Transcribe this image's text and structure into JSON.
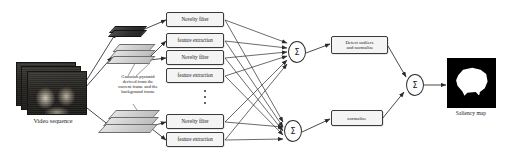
{
  "diagram": {
    "input": {
      "caption": "Video sequence"
    },
    "annotation": {
      "lines": [
        "Gaussian pyramid",
        "derived from the",
        "current frame and the",
        "background frame"
      ]
    },
    "ellipsis": "vertical-ellipsis",
    "branches": [
      {
        "id": "top",
        "boxes": [
          {
            "label": "Novelty filter"
          },
          {
            "label": "feature extraction"
          }
        ]
      },
      {
        "id": "middle",
        "boxes": [
          {
            "label": "Novelty filter"
          },
          {
            "label": "feature extraction"
          }
        ]
      },
      {
        "id": "bottom",
        "boxes": [
          {
            "label": "Novelty filter"
          },
          {
            "label": "feature extraction"
          }
        ]
      }
    ],
    "summation": {
      "symbol": "Σ",
      "nodes": [
        {
          "id": "sum-top"
        },
        {
          "id": "sum-bottom"
        },
        {
          "id": "sum-final"
        }
      ]
    },
    "post_processing": [
      {
        "id": "outliers",
        "lines": [
          "Detect outliers",
          "and normalize"
        ]
      },
      {
        "id": "normalize",
        "lines": [
          "normalize"
        ]
      }
    ],
    "output": {
      "caption": "Saliency map"
    },
    "colors": {
      "box_fill": "#f4f4f4",
      "box_border": "#3a3a3a",
      "wire": "#2b2b2b",
      "slab_light": "#d4d4d4",
      "slab_dark": "#2f2f2f",
      "map_background": "#000000",
      "map_blob": "#ffffff",
      "page_background": "#ffffff"
    }
  }
}
